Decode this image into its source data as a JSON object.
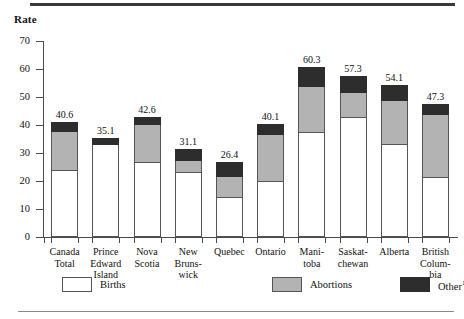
{
  "chart_data": {
    "type": "bar",
    "subtype": "stacked-vertical",
    "title": "",
    "xlabel": "",
    "ylabel": "Rate",
    "ylim": [
      0,
      70
    ],
    "yticks": [
      0,
      10,
      20,
      30,
      40,
      50,
      60,
      70
    ],
    "grid": false,
    "legend_position": "bottom",
    "categories": [
      "Canada Total",
      "Prince Edward Island",
      "Nova Scotia",
      "New Brunswick",
      "Quebec",
      "Ontario",
      "Manitoba",
      "Saskatchewan",
      "Alberta",
      "British Columbia"
    ],
    "category_label_lines": [
      [
        "Canada",
        "Total"
      ],
      [
        "Prince",
        "Edward",
        "Island"
      ],
      [
        "Nova",
        "Scotia"
      ],
      [
        "New",
        "Bruns-",
        "wick"
      ],
      [
        "Quebec"
      ],
      [
        "Ontario"
      ],
      [
        "Mani-",
        "toba"
      ],
      [
        "Saskat-",
        "chewan"
      ],
      [
        "Alberta"
      ],
      [
        "British",
        "Colum-",
        "bia"
      ]
    ],
    "series": [
      {
        "name": "Births",
        "color": "#ffffff",
        "values": [
          23.5,
          32.8,
          26.5,
          23.0,
          14.0,
          19.5,
          37.0,
          42.5,
          32.8,
          21.0
        ]
      },
      {
        "name": "Abortions",
        "color": "#b3b3b3",
        "values": [
          14.0,
          0.0,
          13.5,
          4.0,
          7.5,
          17.0,
          16.5,
          9.0,
          15.7,
          22.5
        ]
      },
      {
        "name": "Other",
        "color": "#2d2d2d",
        "values": [
          3.1,
          2.3,
          2.6,
          4.1,
          4.9,
          3.6,
          6.8,
          5.8,
          5.6,
          3.8
        ]
      }
    ],
    "totals": [
      40.6,
      35.1,
      42.6,
      31.1,
      26.4,
      40.1,
      60.3,
      57.3,
      54.1,
      47.3
    ],
    "total_labels": [
      "40.6",
      "35.1",
      "42.6",
      "31.1",
      "26.4",
      "40.1",
      "60.3",
      "57.3",
      "54.1",
      "47.3"
    ],
    "legend": [
      {
        "label": "Births",
        "color": "#ffffff",
        "footnote": ""
      },
      {
        "label": "Abortions",
        "color": "#b3b3b3",
        "footnote": ""
      },
      {
        "label": "Other",
        "color": "#2d2d2d",
        "footnote": "1"
      }
    ]
  },
  "axis": {
    "y_title": "Rate",
    "y_tick_labels": [
      "70",
      "60",
      "50",
      "40",
      "30",
      "20",
      "10",
      "0"
    ]
  }
}
